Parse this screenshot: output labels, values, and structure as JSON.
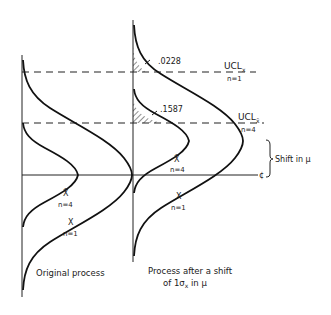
{
  "figure": {
    "left_panel": {
      "caption": "Original process",
      "curves": [
        {
          "label_symbol": "X̄",
          "label_n": "n=4"
        },
        {
          "label_symbol": "X",
          "label_n": "n=1"
        }
      ]
    },
    "right_panel": {
      "caption_line1": "Process after a shift",
      "caption_line2": "of 1σ",
      "caption_sub": "x",
      "caption_line2_tail": " in μ",
      "curves": [
        {
          "label_symbol": "X̄",
          "label_n": "n=4"
        },
        {
          "label_symbol": "X",
          "label_n": "n=1"
        }
      ],
      "tail_areas": [
        {
          "value": ".0228",
          "limit": "UCL n=1"
        },
        {
          "value": ".1587",
          "limit": "UCL n=4"
        }
      ]
    },
    "control_limits": [
      {
        "name": "UCL",
        "sub": "x",
        "n": "n=1"
      },
      {
        "name": "UCL",
        "sub": "x̄",
        "n": "n=4"
      }
    ],
    "center_line_mark": "¢",
    "shift_label": "Shift in μ"
  }
}
